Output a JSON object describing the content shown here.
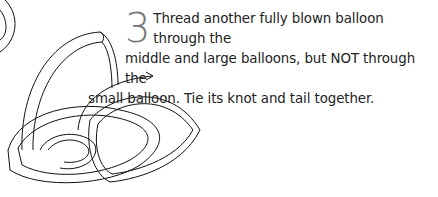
{
  "step": {
    "number": "3",
    "line1": "Thread another fully blown balloon through the",
    "line2": "middle and large balloons, but NOT through the",
    "line3": "small balloon. Tie its knot and tail together."
  },
  "illustration": {
    "description": "Line drawing of three interlinked balloon loops with an arrow showing threading direction",
    "arrow-icon": "arrow-right"
  },
  "colors": {
    "number": "#777777",
    "text": "#222222",
    "line": "#111111"
  }
}
